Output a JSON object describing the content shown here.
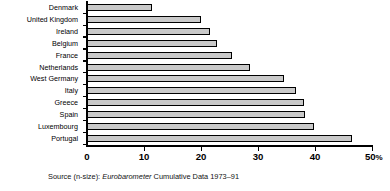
{
  "chart_data": {
    "type": "bar",
    "orientation": "horizontal",
    "title": "",
    "subtitle": "",
    "xlabel": "",
    "ylabel": "",
    "xlim": [
      0,
      50
    ],
    "grid": false,
    "legend": null,
    "categories": [
      "Denmark",
      "United Kingdom",
      "Ireland",
      "Belgium",
      "France",
      "Netherlands",
      "West Germany",
      "Italy",
      "Greece",
      "Spain",
      "Luxembourg",
      "Portugal"
    ],
    "values": [
      11.4,
      20.0,
      21.6,
      22.8,
      25.4,
      28.6,
      34.6,
      36.7,
      38.0,
      38.3,
      39.8,
      46.5
    ],
    "xticks": [
      0,
      10,
      20,
      30,
      40,
      50
    ],
    "xtick_labels": [
      "0",
      "10",
      "20",
      "30",
      "40",
      "50"
    ],
    "xtick_suffix_last": "%",
    "bar_fill": "#c9c9c9",
    "bar_edge": "#000000"
  },
  "source": {
    "prefix": "Source (n-size): ",
    "emphasis": "Eurobarometer",
    "suffix": " Cumulative Data 1973–91"
  }
}
